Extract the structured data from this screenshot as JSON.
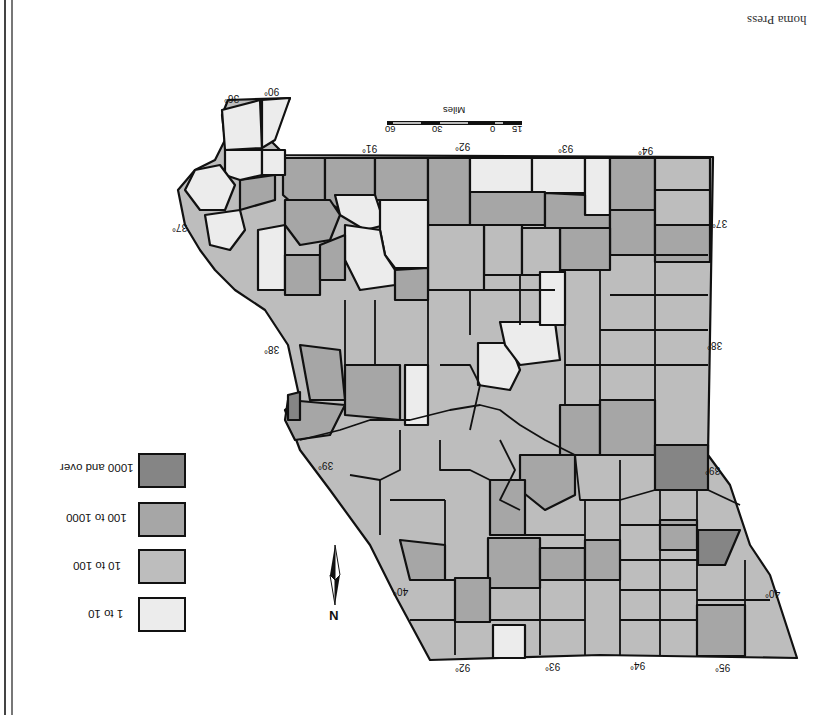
{
  "credit": "homa Press",
  "orientation": "rotated 180 degrees",
  "legend": {
    "items": [
      {
        "label": "1000 and over",
        "color": "#858585"
      },
      {
        "label": "100 to 1000",
        "color": "#a6a6a6"
      },
      {
        "label": "10 to 100",
        "color": "#bdbdbd"
      },
      {
        "label": "1 to 10",
        "color": "#ececec"
      }
    ]
  },
  "scale": {
    "title": "Miles",
    "ticks": [
      "15",
      "0",
      "30",
      "60"
    ]
  },
  "compass": {
    "label": "N"
  },
  "longitude_ticks_top": [
    "90°",
    "91°",
    "92°",
    "93°",
    "94°"
  ],
  "longitude_ticks_bottom": [
    "92°",
    "93°",
    "94°",
    "95°"
  ],
  "latitude_ticks": [
    "36°",
    "37°",
    "38°",
    "39°",
    "40°"
  ],
  "colors": {
    "class_1000_over": "#858585",
    "class_100_1000": "#a6a6a6",
    "class_10_100": "#bdbdbd",
    "class_1_10": "#ececec",
    "border": "#111111"
  }
}
